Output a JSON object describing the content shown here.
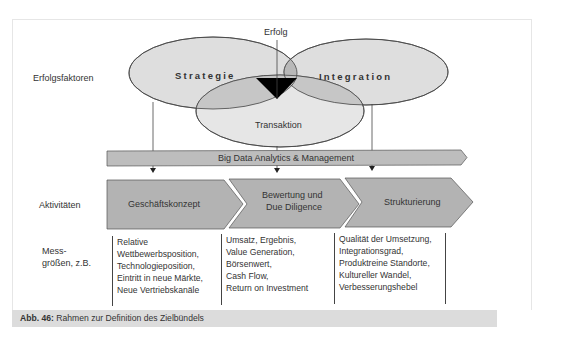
{
  "diagram": {
    "success_label": "Erfolg",
    "ellipses": [
      {
        "label": "Strategie",
        "fill": "#dedede"
      },
      {
        "label": "Integration",
        "fill": "#dedede"
      },
      {
        "label": "Transaktion",
        "fill": "#e4e4e4"
      }
    ],
    "overlap_fill": "#b8b8b8",
    "core_fill": "#000000",
    "banner_label": "Big Data Analytics & Management",
    "banner_fill": "#bdbdbd",
    "chevron_fill": "#b3b3b3",
    "activities": [
      {
        "label_line1": "Geschäftskonzept",
        "label_line2": ""
      },
      {
        "label_line1": "Bewertung und",
        "label_line2": "Due Diligence"
      },
      {
        "label_line1": "Strukturierung",
        "label_line2": ""
      }
    ]
  },
  "rows": {
    "success_factors": "Erfolgsfaktoren",
    "activities": "Aktivitäten",
    "metrics_line1": "Mess-",
    "metrics_line2": "größen, z.B."
  },
  "metrics": [
    {
      "lines": [
        "Relative",
        "Wettbewerbsposition,",
        "Technologieposition,",
        "Eintritt in neue Märkte,",
        "Neue Vertriebskanäle"
      ]
    },
    {
      "lines": [
        "Umsatz, Ergebnis,",
        "Value Generation,",
        "Börsenwert,",
        "Cash Flow,",
        "Return on Investment"
      ]
    },
    {
      "lines": [
        "Qualität der Umsetzung,",
        "Integrationsgrad,",
        "Produktreine Standorte,",
        "Kultureller Wandel,",
        "Verbesserungshebel"
      ]
    }
  ],
  "caption": {
    "number": "Abb. 46:",
    "text": " Rahmen zur Definition des Zielbündels"
  }
}
